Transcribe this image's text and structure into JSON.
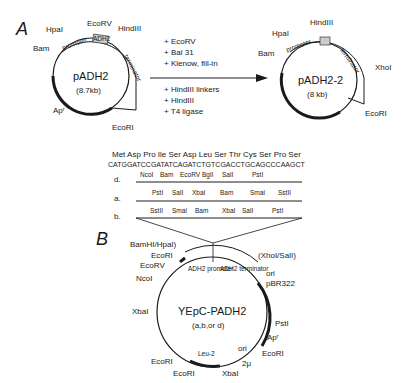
{
  "panel_a": {
    "label": "A",
    "plasmid1": {
      "name": "pADH2",
      "size": "(8.7kb)",
      "sites": [
        "EcoRV",
        "HindIII",
        "HpaI",
        "Bam",
        "EcoRI",
        "Apʳ"
      ],
      "segments": [
        "promoter",
        "ADH2",
        "terminator"
      ]
    },
    "steps1": [
      "+ EcoRV",
      "+ Bal 31",
      "+ Klenow, fill-in"
    ],
    "steps2": [
      "+ HindIII linkers",
      "+ HindIII",
      "+ T4 ligase"
    ],
    "plasmid2": {
      "name": "pADH2-2",
      "size": "(8 kb)",
      "sites": [
        "HindIII",
        "HpaI",
        "Bam",
        "XhoI",
        "EcoRI"
      ],
      "segments": [
        "promoter",
        "terminator"
      ]
    }
  },
  "sequence": {
    "amino_acids": "Met Asp Pro Ile Ser Asp Leu Ser Thr Cys Ser Pro Ser",
    "dna": "CATGGATCCGATATCAGATCTGTCGACCTGCAGCCCAAGCT"
  },
  "linkers": [
    {
      "label": "d.",
      "sites": [
        "NcoI",
        "Bam",
        "EcoRV",
        "BglI",
        "SalI",
        "PstI"
      ]
    },
    {
      "label": "a.",
      "sites": [
        "PstI",
        "SalI",
        "XbaI",
        "Bam",
        "SmaI",
        "SstII"
      ]
    },
    {
      "label": "b.",
      "sites": [
        "SstII",
        "SmaI",
        "Bam",
        "XbaI",
        "SalI",
        "PstI"
      ]
    }
  ],
  "panel_b": {
    "label": "B",
    "plasmid": {
      "name": "YEpC-PADH2",
      "variants": "(a,b,or d)",
      "segments": [
        "ADH2 promoter",
        "ADH2 terminator"
      ],
      "sites_left": [
        "BamHI/HpaI)",
        "EcoRI",
        "EcoRV",
        "NcoI",
        "XbaI",
        "EcoRI",
        "EcoRI"
      ],
      "sites_right": [
        "(XhoI/SalI)",
        "ori",
        "pBR322",
        "PstI",
        "Apʳ",
        "ori",
        "EcoRI",
        "2μ",
        "XbaI"
      ],
      "features": [
        "Leu-2"
      ]
    }
  }
}
